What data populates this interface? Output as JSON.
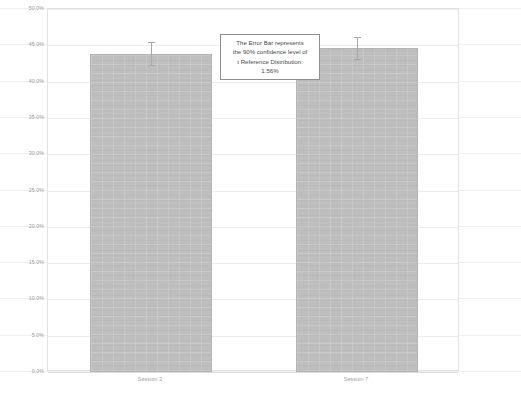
{
  "chart_data": {
    "type": "bar",
    "title": "",
    "xlabel": "",
    "ylabel": "",
    "categories": [
      "Session 2",
      "Session 7"
    ],
    "values": [
      43.8,
      44.6
    ],
    "errors": [
      1.56,
      1.56
    ],
    "error_low": [
      42.2,
      43.0
    ],
    "error_high": [
      45.4,
      46.2
    ],
    "ylim": [
      0.0,
      50.0
    ],
    "ytick_step": 5.0,
    "ytick_labels": [
      "50.0%",
      "45.0%",
      "40.0%",
      "35.0%",
      "30.0%",
      "25.0%",
      "20.0%",
      "15.0%",
      "10.0%",
      "5.0%",
      "0.0%"
    ],
    "ytick_values": [
      50.0,
      45.0,
      40.0,
      35.0,
      30.0,
      25.0,
      20.0,
      15.0,
      10.0,
      5.0,
      0.0
    ],
    "grid": true,
    "legend": "none",
    "bar_color": "#bebebe",
    "errorbar_color": "#a8a8a8",
    "gridline_color": "#ececec",
    "annotations": [
      {
        "name": "error-bar-explanation",
        "lines": [
          "The Error Bar represents",
          "the 90% confidence level of",
          "t Reference Distribution:",
          "1.56%"
        ]
      }
    ]
  }
}
